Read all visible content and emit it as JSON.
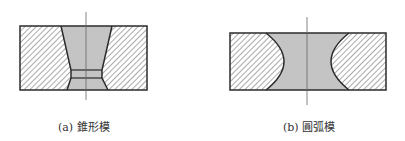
{
  "figures": [
    {
      "id": "a",
      "caption": "(a) 錐形模",
      "type": "tapered-die"
    },
    {
      "id": "b",
      "caption": "(b) 圓弧模",
      "type": "arc-die"
    }
  ],
  "colors": {
    "outline": "#2b2b2b",
    "hatch": "#555555",
    "cavity_fill": "#c4c4c4",
    "centerline": "#666666",
    "background": "#ffffff"
  }
}
